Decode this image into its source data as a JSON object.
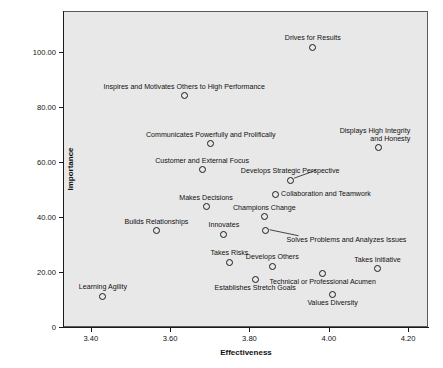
{
  "chart_data": {
    "type": "scatter",
    "title": "",
    "xlabel": "Effectiveness",
    "ylabel": "Importance",
    "xlim": [
      3.33,
      4.25
    ],
    "ylim": [
      0,
      115
    ],
    "grid": false,
    "legend": "none",
    "xticks": [
      "3.40",
      "3.60",
      "3.80",
      "4.00",
      "4.20"
    ],
    "xtick_values": [
      3.4,
      3.6,
      3.8,
      4.0,
      4.2
    ],
    "yticks": [
      "0",
      "20.00",
      "40.00",
      "60.00",
      "80.00",
      "100.00"
    ],
    "ytick_values": [
      0,
      20,
      40,
      60,
      80,
      100
    ],
    "points": [
      {
        "label": "Drives for Results",
        "x": 3.957,
        "y": 102.2,
        "label_pos": "above-center",
        "leader": false
      },
      {
        "label": "Inspires and Motivates Others to High Performance",
        "x": 3.633,
        "y": 84.6,
        "label_pos": "above-center",
        "leader": false
      },
      {
        "label": "Communicates Powerfully and Prolifically",
        "x": 3.7,
        "y": 67.0,
        "label_pos": "above-center",
        "leader": false
      },
      {
        "label": "Displays High Integrity and Honesty",
        "label_line1": "Displays High Integrity",
        "label_line2": "and Honesty",
        "x": 4.122,
        "y": 65.6,
        "label_pos": "above-two-line-right",
        "leader": false
      },
      {
        "label": "Customer and External Focus",
        "x": 3.678,
        "y": 57.6,
        "label_pos": "above-center",
        "leader": false
      },
      {
        "label": "Develops Strategic Perspective",
        "x": 3.9,
        "y": 53.8,
        "label_pos": "above-center",
        "leader": true
      },
      {
        "label": "Collaboration and Teamwork",
        "x": 3.862,
        "y": 48.6,
        "label_pos": "right",
        "leader": false
      },
      {
        "label": "Makes Decisions",
        "x": 3.688,
        "y": 44.2,
        "label_pos": "above-center",
        "leader": false
      },
      {
        "label": "Champions Change",
        "x": 3.835,
        "y": 40.5,
        "label_pos": "above-center",
        "leader": false
      },
      {
        "label": "Builds Relationships",
        "x": 3.563,
        "y": 35.4,
        "label_pos": "above-center",
        "leader": false
      },
      {
        "label": "Solves Problems and Analyzes Issues",
        "x": 3.838,
        "y": 35.4,
        "label_pos": "below-right",
        "leader": true
      },
      {
        "label": "Innovates",
        "x": 3.733,
        "y": 34.1,
        "label_pos": "above-center",
        "leader": false
      },
      {
        "label": "Takes Risks",
        "x": 3.747,
        "y": 23.9,
        "label_pos": "above-center",
        "leader": false
      },
      {
        "label": "Developsses Others",
        "display_label": "Develops Others",
        "x": 3.855,
        "y": 22.5,
        "label_pos": "above-center",
        "leader": false
      },
      {
        "label": "Takes Initiative",
        "x": 4.12,
        "y": 21.5,
        "label_pos": "above-center",
        "leader": false
      },
      {
        "label": "Technical or Professional Acumen",
        "x": 3.982,
        "y": 20.0,
        "label_pos": "below-center",
        "leader": false
      },
      {
        "label": "Establishes Stretch Goals",
        "x": 3.812,
        "y": 17.7,
        "label_pos": "below-center",
        "leader": false
      },
      {
        "label": "Values Diversity",
        "x": 4.007,
        "y": 12.3,
        "label_pos": "below-center",
        "leader": false
      },
      {
        "label": "Learning Agility",
        "x": 3.428,
        "y": 11.5,
        "label_pos": "above-center",
        "leader": false
      }
    ],
    "colors": {
      "panel_background": "#e8e8e8",
      "figure_background": "#ffffff",
      "marker_stroke": "#1a1a1a",
      "axis": "#1a1a1a",
      "text": "#111111"
    }
  }
}
